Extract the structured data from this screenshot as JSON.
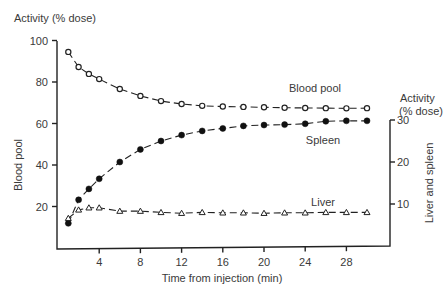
{
  "chart_data": {
    "type": "line",
    "title": "",
    "left_axis": {
      "title": "Activity (% dose)",
      "label": "Blood pool",
      "range": [
        0,
        100
      ],
      "ticks": [
        20,
        40,
        60,
        80,
        100
      ],
      "tick_labels": [
        "20",
        "40",
        "60",
        "80",
        "100"
      ]
    },
    "right_axis": {
      "title_line1": "Activity",
      "title_line2": "(% dose)",
      "label": "Liver and spleen",
      "range": [
        0,
        30
      ],
      "ticks": [
        10,
        20,
        30
      ],
      "tick_labels": [
        "10",
        "20",
        "30"
      ]
    },
    "x_axis": {
      "label": "Time from injection (min)",
      "range": [
        0,
        30
      ],
      "ticks": [
        4,
        8,
        12,
        16,
        20,
        24,
        28
      ],
      "tick_labels": [
        "4",
        "8",
        "12",
        "16",
        "20",
        "24",
        "28"
      ]
    },
    "x": [
      1,
      2,
      3,
      4,
      6,
      8,
      10,
      12,
      14,
      16,
      18,
      20,
      22,
      24,
      26,
      28,
      30
    ],
    "series": [
      {
        "name": "Blood pool",
        "axis": "left",
        "marker": "open-circle",
        "values": [
          94.5,
          87.2,
          83.9,
          81.4,
          76.6,
          73.3,
          70.8,
          69.4,
          68.5,
          68.2,
          68.0,
          67.8,
          67.6,
          67.5,
          67.4,
          67.3,
          67.4
        ]
      },
      {
        "name": "Spleen",
        "axis": "right",
        "marker": "filled-circle",
        "values": [
          5.4,
          11.0,
          13.6,
          16.0,
          20.0,
          23.0,
          25.0,
          26.4,
          27.4,
          28.0,
          28.6,
          28.8,
          28.9,
          29.1,
          29.7,
          29.8,
          29.8
        ]
      },
      {
        "name": "Liver",
        "axis": "right",
        "marker": "open-triangle",
        "values": [
          6.6,
          8.6,
          9.1,
          9.1,
          8.3,
          8.3,
          8.0,
          7.8,
          8.0,
          7.9,
          7.9,
          7.8,
          7.9,
          7.9,
          8.0,
          8.0,
          8.0
        ]
      }
    ],
    "annotations": [
      "Blood pool",
      "Spleen",
      "Liver"
    ],
    "legend": "none (inline series labels)",
    "grid": false
  }
}
